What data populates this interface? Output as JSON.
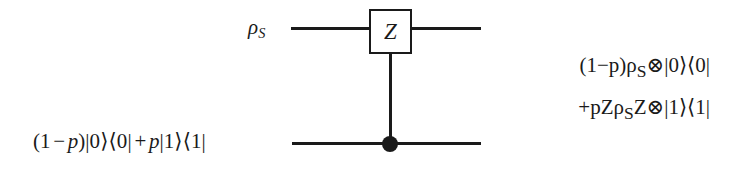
{
  "figure": {
    "kind": "quantum-circuit-diagram",
    "background_color": "#ffffff",
    "line_color": "#1a1a1a",
    "width": 739,
    "height": 169
  },
  "gate": {
    "label": "Z",
    "type": "controlled-phase-flip",
    "control": "filled-dot"
  },
  "wires": {
    "top": {
      "input_label_plain": "ρS",
      "input_label_html": "<span class=\"it\">ρ</span><sub>S</sub>"
    },
    "bottom": {
      "input_label_plain": "(1 − p)|0⟩⟨0| + p|1⟩⟨1|",
      "input_label_html": "<span class=\"paren\">(</span><span class=\"up\">1</span><span class=\"op\">−</span><span class=\"it\">p</span><span class=\"paren\">)</span><span class=\"ket\">|0⟩</span><span class=\"bra\">⟨0|</span><span class=\"op\">+</span><span class=\"it\">p</span><span class=\"ket\">|1⟩</span><span class=\"bra\">⟨1|</span>"
    }
  },
  "output": {
    "line1_plain": "(1 − p)ρS ⊗ |0⟩⟨0|",
    "line1_html": "<span class=\"paren\">(</span><span class=\"up\">1</span><span class=\"op\">−</span><span class=\"it\">p</span><span class=\"paren\">)</span><span class=\"it\">ρ</span><sub>S</sub><span class=\"tensor\">⊗</span><span class=\"ket\">|0⟩</span><span class=\"bra\">⟨0|</span>",
    "line2_plain": "+ pZρSZ ⊗ |1⟩⟨1|",
    "line2_html": "<span class=\"op\">+</span><span class=\"it\">p</span><span class=\"it\">Z</span><span class=\"it\">ρ</span><sub>S</sub><span class=\"it\">Z</span><span class=\"tensor\">⊗</span><span class=\"ket\">|1⟩</span><span class=\"bra\">⟨1|</span>"
  }
}
